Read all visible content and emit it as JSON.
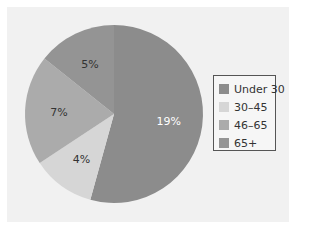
{
  "chart_data": {
    "type": "pie",
    "title": "",
    "categories": [
      "Under 30",
      "30–45",
      "46–65",
      "65+"
    ],
    "values": [
      19,
      4,
      7,
      5
    ],
    "labels": [
      "19%",
      "4%",
      "7%",
      "5%"
    ],
    "colors": [
      "#8c8c8c",
      "#d6d6d6",
      "#ababab",
      "#949494"
    ],
    "label_colors": [
      "#ffffff",
      "#333333",
      "#333333",
      "#333333"
    ],
    "start_angle_deg": 0,
    "direction": "clockwise",
    "legend_position": "right"
  },
  "legend": {
    "items": [
      {
        "label": "Under 30",
        "color": "#8c8c8c"
      },
      {
        "label": "30–45",
        "color": "#d6d6d6"
      },
      {
        "label": "46–65",
        "color": "#ababab"
      },
      {
        "label": "65+",
        "color": "#949494"
      }
    ]
  }
}
